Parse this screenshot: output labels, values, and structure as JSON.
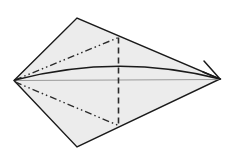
{
  "figure": {
    "canvas": {
      "width": 234,
      "height": 154
    },
    "background_color": "#ffffff",
    "paper": {
      "name": "kite-shaped paper outline",
      "fill_color": "#ececec",
      "stroke_color": "#1a1a1a",
      "stroke_width": 1.4,
      "vertices": [
        {
          "name": "left-point",
          "x": 14,
          "y": 80.5
        },
        {
          "name": "top-point",
          "x": 77,
          "y": 18
        },
        {
          "name": "right-point",
          "x": 220,
          "y": 79
        },
        {
          "name": "bottom-point",
          "x": 77,
          "y": 147
        }
      ]
    },
    "lines": [
      {
        "name": "vertical-valley-fold",
        "style": "dashed",
        "stroke_color": "#2b2b2b",
        "stroke_width": 1.6,
        "dash_pattern": "6 4",
        "x1": 118.5,
        "y1": 37.5,
        "x2": 118.5,
        "y2": 125.5
      },
      {
        "name": "upper-mountain-fold",
        "style": "dash-dot-dot",
        "stroke_color": "#2b2b2b",
        "stroke_width": 1.4,
        "dash_pattern": "7 3 1.5 3 1.5 3",
        "x1": 15,
        "y1": 80,
        "x2": 118.5,
        "y2": 37.5
      },
      {
        "name": "lower-mountain-fold",
        "style": "dash-dot-dot",
        "stroke_color": "#2b2b2b",
        "stroke_width": 1.4,
        "dash_pattern": "7 3 1.5 3 1.5 3",
        "x1": 15,
        "y1": 82,
        "x2": 118.5,
        "y2": 125.5
      },
      {
        "name": "horizontal-center-reference-line",
        "style": "solid",
        "stroke_color": "#9a9a9a",
        "stroke_width": 1,
        "x1": 15,
        "y1": 80.5,
        "x2": 219,
        "y2": 79.5
      }
    ],
    "arrow": {
      "name": "fold-direction-arrow",
      "style": "curved-solid",
      "stroke_color": "#1a1a1a",
      "stroke_width": 1.5,
      "start": {
        "x": 15,
        "y": 80
      },
      "control": {
        "x": 118,
        "y": 53
      },
      "end": {
        "x": 220,
        "y": 79
      },
      "head": {
        "name": "arrowhead",
        "type": "open-barb",
        "barb_tip": {
          "x": 204,
          "y": 61
        }
      }
    }
  }
}
